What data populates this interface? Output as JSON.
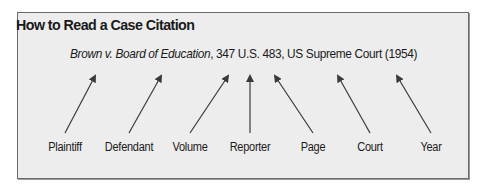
{
  "title": "How to Read a Case Citation",
  "citation": {
    "case_name": "Brown v. Board of Education",
    "rest": ", 347 U.S. 483, US Supreme Court (1954)"
  },
  "labels": [
    {
      "text": "Plaintiff",
      "x": 65
    },
    {
      "text": "Defendant",
      "x": 129
    },
    {
      "text": "Volume",
      "x": 190
    },
    {
      "text": "Reporter",
      "x": 250
    },
    {
      "text": "Page",
      "x": 313
    },
    {
      "text": "Court",
      "x": 370
    },
    {
      "text": "Year",
      "x": 431
    }
  ],
  "colors": {
    "background": "#ededed",
    "border": "#6a6a6a",
    "text": "#1a1a1a",
    "arrow": "#3a3a3a"
  }
}
